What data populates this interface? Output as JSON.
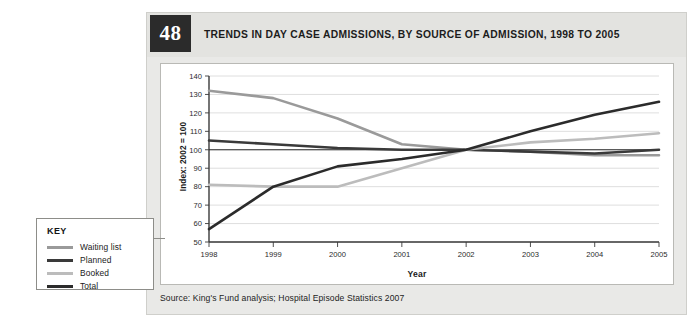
{
  "figure": {
    "number": "48",
    "title": "TRENDS IN DAY CASE ADMISSIONS, BY SOURCE OF ADMISSION, 1998 TO 2005",
    "source": "Source: King's Fund analysis; Hospital Episode Statistics 2007"
  },
  "key": {
    "title": "KEY",
    "items": [
      {
        "label": "Waiting list",
        "color": "#9a9a9a"
      },
      {
        "label": "Planned",
        "color": "#3a3a3a"
      },
      {
        "label": "Booked",
        "color": "#bcbcbc"
      },
      {
        "label": "Total",
        "color": "#2b2b2b"
      }
    ]
  },
  "chart_data": {
    "type": "line",
    "title": "TRENDS IN DAY CASE ADMISSIONS, BY SOURCE OF ADMISSION, 1998 TO 2005",
    "xlabel": "Year",
    "ylabel": "Index: 2002 = 100",
    "categories": [
      "1998",
      "1999",
      "2000",
      "2001",
      "2002",
      "2003",
      "2004",
      "2005"
    ],
    "x": [
      1998,
      1999,
      2000,
      2001,
      2002,
      2003,
      2004,
      2005
    ],
    "ylim": [
      50,
      140
    ],
    "yticks": [
      50,
      60,
      70,
      80,
      90,
      100,
      110,
      120,
      130,
      140
    ],
    "grid": "horizontal",
    "legend_position": "external-left",
    "reference_line": 100,
    "series": [
      {
        "name": "Waiting list",
        "color": "#9a9a9a",
        "values": [
          132,
          128,
          117,
          103,
          100,
          99,
          97,
          97
        ]
      },
      {
        "name": "Planned",
        "color": "#3a3a3a",
        "values": [
          105,
          103,
          101,
          100,
          100,
          99,
          98,
          100
        ]
      },
      {
        "name": "Booked",
        "color": "#bcbcbc",
        "values": [
          81,
          80,
          80,
          90,
          100,
          104,
          106,
          109
        ]
      },
      {
        "name": "Total",
        "color": "#2b2b2b",
        "values": [
          57,
          80,
          91,
          95,
          100,
          110,
          119,
          126
        ]
      }
    ]
  }
}
